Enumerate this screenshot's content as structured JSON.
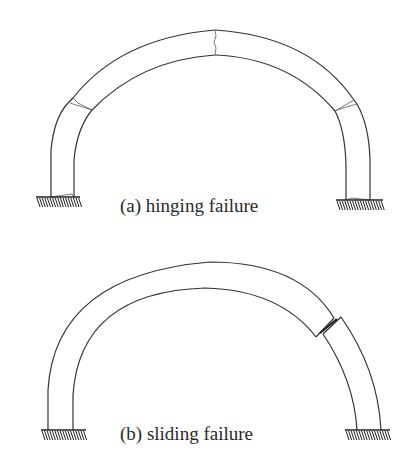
{
  "figure": {
    "background": "#ffffff",
    "line_color": "#333333",
    "panels": [
      {
        "id": "a",
        "caption": "(a) hinging failure",
        "caption_pos": [
          120,
          212
        ],
        "outer_arc": {
          "left_block": "M51,197 L51,150 Q54,118 68,103",
          "left_hinge_gap": "M68,103 L73,98",
          "crown_left": "M73,98 Q120,38 215,30",
          "crown_right": "M215,30 Q310,36 354,100",
          "right_hinge_gap": "M354,100 L357,104",
          "right_block": "M357,104 Q369,125 370,160 L370,200"
        },
        "inner_arc": {
          "left_block": "M74,197 L74,160 Q77,128 92,110",
          "crown_left": "M92,110 Q140,60 215,55",
          "crown_right": "M215,55 Q290,58 335,111",
          "right_block": "M335,111 Q345,130 346,165 L346,200"
        },
        "cracks": [
          "M215,30 L216,36 L214,42 L216,48 L215,55",
          "M70,103 L92,110",
          "M73,98 L78,103 L92,110",
          "M354,100 L335,111",
          "M357,104 L340,109 L335,111",
          "M51,197 L72,194 L74,197",
          "M346,200 L352,198 L370,200"
        ],
        "supports": [
          {
            "x1": 36,
            "x2": 80,
            "y": 197
          },
          {
            "x1": 336,
            "x2": 383,
            "y": 200
          }
        ]
      },
      {
        "id": "b",
        "caption": "(b) sliding failure",
        "caption_pos": [
          120,
          440
        ],
        "outer_arc": {
          "main": "M48,430 L48,390 Q55,275 210,262 Q300,262 334,318",
          "right_block": "M341,317 Q378,370 381,430"
        },
        "inner_arc": {
          "main": "M73,430 L73,395 Q80,292 205,288 Q280,290 316,337",
          "right_block": "M323,334 Q354,380 357,430"
        },
        "joint_edges": [
          "M334,318 L316,337",
          "M341,317 L323,334"
        ],
        "sliding_joint": "M320,333 L337,319",
        "supports": [
          {
            "x1": 41,
            "x2": 86,
            "y": 430
          },
          {
            "x1": 345,
            "x2": 390,
            "y": 430
          }
        ]
      }
    ]
  }
}
